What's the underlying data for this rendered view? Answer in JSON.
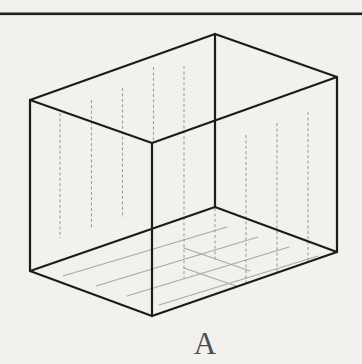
{
  "figure": {
    "label": "A",
    "colors": {
      "background": "#f2f1ed",
      "rule": "#1f1f1f",
      "edge": "#1c1c1c",
      "field_line": "#9e9e9e",
      "floor_line": "#a8a8a8",
      "label": "#4c4c4c"
    },
    "canvas": {
      "width": 362,
      "height": 364
    },
    "top_rule": {
      "x1": 0,
      "x2": 362,
      "y": 13.8,
      "thickness": 2.6
    },
    "box": {
      "vertices": {
        "t_back": [
          215,
          34
        ],
        "t_left": [
          30,
          100
        ],
        "t_front": [
          152,
          143
        ],
        "t_right": [
          337,
          77
        ],
        "b_left": [
          30,
          271
        ],
        "b_front": [
          152,
          316
        ],
        "b_right": [
          337,
          252
        ],
        "b_back": [
          215,
          207
        ]
      },
      "edges": [
        [
          "t_left",
          "t_back"
        ],
        [
          "t_back",
          "t_right"
        ],
        [
          "t_left",
          "t_front"
        ],
        [
          "t_front",
          "t_right"
        ],
        [
          "t_left",
          "b_left"
        ],
        [
          "t_front",
          "b_front"
        ],
        [
          "t_right",
          "b_right"
        ],
        [
          "t_back",
          "b_back"
        ],
        [
          "b_left",
          "b_front"
        ],
        [
          "b_front",
          "b_right"
        ],
        [
          "b_left",
          "b_back"
        ],
        [
          "b_back",
          "b_right"
        ]
      ],
      "edge_width": 2.2
    },
    "field_lines": [
      {
        "x": 60,
        "y1": 113,
        "y2": 238
      },
      {
        "x": 91.5,
        "y1": 100,
        "y2": 228
      },
      {
        "x": 122.5,
        "y1": 88,
        "y2": 218
      },
      {
        "x": 153.5,
        "y1": 67,
        "y2": 142
      },
      {
        "x": 184,
        "y1": 66,
        "y2": 278
      },
      {
        "x": 215,
        "y1": 208,
        "y2": 262
      },
      {
        "x": 246,
        "y1": 135,
        "y2": 284
      },
      {
        "x": 277,
        "y1": 123,
        "y2": 274
      },
      {
        "x": 308,
        "y1": 112,
        "y2": 262
      }
    ],
    "field_line_style": {
      "width": 1.1,
      "dash": "3 2.4"
    },
    "floor_lines": [
      {
        "x1": 63,
        "y1": 276,
        "x2": 227,
        "y2": 227
      },
      {
        "x1": 96,
        "y1": 286,
        "x2": 258,
        "y2": 237
      },
      {
        "x1": 127,
        "y1": 296,
        "x2": 289,
        "y2": 247
      },
      {
        "x1": 159,
        "y1": 305,
        "x2": 318,
        "y2": 256
      },
      {
        "x1": 184,
        "y1": 248,
        "x2": 250,
        "y2": 271
      },
      {
        "x1": 184,
        "y1": 268,
        "x2": 236,
        "y2": 286
      }
    ],
    "floor_line_style": {
      "width": 1.1
    },
    "label_pos": {
      "x": 205,
      "y": 328,
      "font_size": 31
    }
  }
}
